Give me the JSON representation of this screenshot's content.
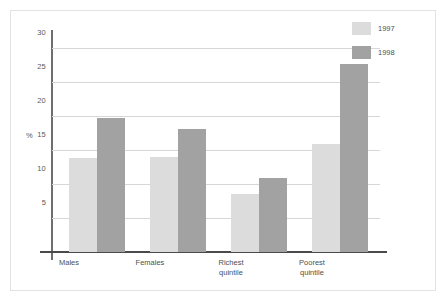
{
  "chart_data": {
    "type": "bar",
    "title": "",
    "subtitle": "",
    "xlabel": "",
    "ylabel": "%",
    "categories": [
      "Males",
      "Females",
      "Richest quintile",
      "Poorest quintile"
    ],
    "category_lines": [
      [
        "Males"
      ],
      [
        "Females"
      ],
      [
        "Richest",
        "quintile"
      ],
      [
        "Poorest",
        "quintile"
      ]
    ],
    "series": [
      {
        "name": "1997",
        "color": "#dcdcdc",
        "values": [
          12.9,
          13.0,
          8.0,
          14.8
        ]
      },
      {
        "name": "1998",
        "color": "#a2a2a2",
        "values": [
          18.4,
          16.8,
          10.1,
          25.8
        ]
      }
    ],
    "ylim": [
      0,
      30
    ],
    "yticks": [
      5,
      10,
      15,
      20,
      25,
      30
    ],
    "ytick_labels": [
      "5",
      "10",
      "15",
      "20",
      "25",
      "30"
    ],
    "grid": true,
    "grid_axis": "y",
    "legend_position": "top-right",
    "annotations": []
  },
  "axes": {
    "y_axis_title": "%",
    "tick_labels": [
      "30",
      "25",
      "20",
      "15",
      "10",
      "5"
    ]
  },
  "legend": {
    "entries": [
      {
        "label": "1997",
        "color": "#dcdcdc"
      },
      {
        "label": "1998",
        "color": "#a2a2a2"
      }
    ]
  },
  "colors": {
    "series_1997": "#dcdcdc",
    "series_1998": "#a2a2a2",
    "gridline": "#d7d7d7",
    "axis": "#4a4a4a",
    "frame": "#e3e3e3",
    "text": "#4f4f4f",
    "background": "#ffffff"
  }
}
